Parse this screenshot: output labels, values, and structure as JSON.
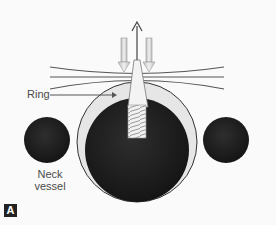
{
  "figure": {
    "panel_label": "A",
    "labels": {
      "ring": "Ring",
      "neck_vessel_line1": "Neck",
      "neck_vessel_line2": "vessel"
    },
    "colors": {
      "background": "#fafafa",
      "vessel_fill": "#1e1e1e",
      "ring_fill": "#e6e6e6",
      "line_color": "#555555",
      "arrow_fill": "#d8d8d8",
      "badge_fill": "#222222"
    }
  }
}
